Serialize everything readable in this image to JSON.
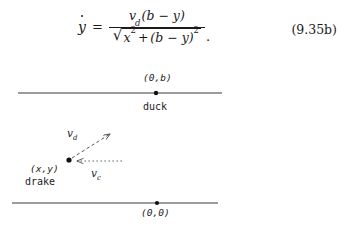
{
  "equation": {
    "lhs": "y",
    "lhs_accent": "dot",
    "relation": "=",
    "numerator": {
      "v": "v",
      "v_sub": "d",
      "expr": "(b − y)"
    },
    "denominator": {
      "radicand_first": "x",
      "radicand_first_sup": "2",
      "plus": "+",
      "radicand_second": "(b − y)",
      "radicand_second_sup": "2"
    },
    "trailing_punctuation": ".",
    "number": "(9.35b)",
    "plain_text": "ẏ = v_d(b − y) / √(x² + (b − y)²)."
  },
  "diagram": {
    "top_line": {
      "point_label": "(0,b)",
      "actor_label": "duck",
      "x_start": 18,
      "x_end": 222,
      "y": 33,
      "point_x": 156
    },
    "bottom_line": {
      "point_label": "(0,0)",
      "actor_label": "",
      "x_start": 12,
      "x_end": 218,
      "y": 143,
      "point_x": 157
    },
    "drake": {
      "point_label": "(x,y)",
      "actor_label": "drake",
      "point_x": 69,
      "point_y": 100
    },
    "vectors": [
      {
        "name": "v",
        "subscript": "d",
        "label": "v_d",
        "from_x": 69,
        "from_y": 100,
        "to_x": 110,
        "to_y": 74,
        "style": "dashed",
        "arrow_at": "end"
      },
      {
        "name": "v",
        "subscript": "c",
        "label": "v_c",
        "from_x": 120,
        "from_y": 101,
        "to_x": 76,
        "to_y": 101,
        "style": "dotted",
        "arrow_at": "end"
      }
    ]
  },
  "colors": {
    "background": "#ffffff",
    "ink": "#1a1a1a",
    "line": "#3a3a3a"
  }
}
